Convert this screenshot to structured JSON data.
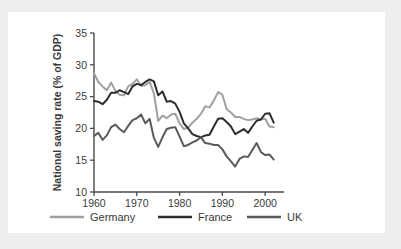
{
  "figure": {
    "background_color": "#ffffff",
    "page_background_color": "#eceeef"
  },
  "chart_data": {
    "type": "line",
    "title": "",
    "subtitle": "",
    "xlabel": "",
    "ylabel": "National saving rate (% of GDP)",
    "xlim": [
      1960,
      2003
    ],
    "ylim": [
      10,
      35
    ],
    "xticks": [
      1960,
      1970,
      1980,
      1990,
      2000
    ],
    "xtick_labels": [
      "1960",
      "1970",
      "1980",
      "1990",
      "2000"
    ],
    "yticks": [
      10,
      15,
      20,
      25,
      30,
      35
    ],
    "ytick_labels": [
      "10",
      "15",
      "20",
      "25",
      "30",
      "35"
    ],
    "grid": false,
    "legend_position": "bottom",
    "x": [
      1960,
      1961,
      1962,
      1963,
      1964,
      1965,
      1966,
      1967,
      1968,
      1969,
      1970,
      1971,
      1972,
      1973,
      1974,
      1975,
      1976,
      1977,
      1978,
      1979,
      1980,
      1981,
      1982,
      1983,
      1984,
      1985,
      1986,
      1987,
      1988,
      1989,
      1990,
      1991,
      1992,
      1993,
      1994,
      1995,
      1996,
      1997,
      1998,
      1999,
      2000,
      2001,
      2002
    ],
    "series": [
      {
        "name": "Germany",
        "color": "#a0a0a0",
        "values": [
          28.7,
          27.3,
          26.6,
          26.0,
          27.2,
          25.9,
          25.3,
          25.2,
          26.6,
          27.0,
          27.7,
          26.7,
          26.8,
          27.3,
          25.5,
          21.2,
          22.0,
          21.6,
          22.2,
          22.3,
          20.8,
          19.9,
          20.1,
          20.9,
          21.5,
          22.3,
          23.5,
          23.3,
          24.4,
          25.7,
          25.3,
          23.0,
          22.5,
          21.8,
          21.8,
          21.5,
          21.3,
          21.4,
          21.6,
          21.4,
          21.5,
          20.3,
          20.2
        ]
      },
      {
        "name": "France",
        "color": "#2d2d2d",
        "values": [
          24.3,
          24.2,
          23.8,
          24.5,
          25.6,
          25.6,
          26.0,
          25.7,
          25.4,
          26.6,
          27.0,
          26.8,
          27.3,
          27.7,
          27.4,
          25.2,
          25.8,
          24.2,
          24.3,
          23.9,
          22.6,
          20.8,
          20.0,
          19.1,
          18.8,
          18.6,
          18.9,
          19.0,
          20.3,
          21.5,
          21.6,
          21.0,
          20.3,
          19.1,
          19.5,
          19.9,
          19.3,
          20.3,
          21.2,
          21.4,
          22.3,
          22.4,
          20.9
        ]
      },
      {
        "name": "UK",
        "color": "#5a5a5a",
        "values": [
          18.8,
          19.3,
          18.2,
          18.9,
          20.2,
          20.6,
          19.9,
          19.4,
          20.4,
          21.3,
          21.6,
          22.2,
          20.8,
          21.5,
          18.5,
          17.1,
          18.6,
          19.9,
          20.1,
          20.2,
          18.7,
          17.2,
          17.4,
          17.8,
          18.1,
          18.6,
          17.7,
          17.6,
          17.4,
          17.4,
          16.7,
          15.6,
          14.8,
          14.0,
          15.2,
          15.6,
          15.5,
          16.6,
          17.7,
          16.3,
          15.8,
          15.9,
          15.1
        ]
      }
    ]
  },
  "legend": {
    "items": [
      {
        "label": "Germany",
        "color": "#a0a0a0"
      },
      {
        "label": "France",
        "color": "#2d2d2d"
      },
      {
        "label": "UK",
        "color": "#5a5a5a"
      }
    ]
  },
  "axes": {
    "axis_color": "#4a4a4a",
    "y_axis_title": "National saving rate (% of GDP)"
  }
}
